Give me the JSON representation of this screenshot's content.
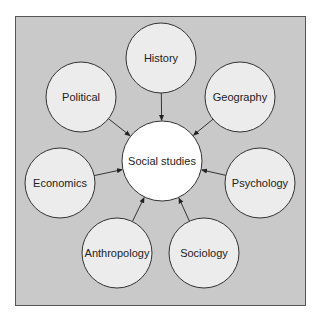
{
  "diagram": {
    "type": "hub-and-spoke concept map",
    "colors": {
      "panel_bg": "#c9c9c9",
      "panel_border": "#555555",
      "node_fill": "#ececec",
      "center_fill": "#ffffff",
      "stroke": "#333333"
    },
    "center": {
      "label": "Social studies",
      "cx": 162,
      "cy": 161,
      "r": 40
    },
    "nodes": [
      {
        "label": "History",
        "cx": 161,
        "cy": 58,
        "r": 35
      },
      {
        "label": "Geography",
        "cx": 240,
        "cy": 97,
        "r": 35
      },
      {
        "label": "Psychology",
        "cx": 260,
        "cy": 183,
        "r": 35
      },
      {
        "label": "Sociology",
        "cx": 204,
        "cy": 253,
        "r": 35
      },
      {
        "label": "Anthropology",
        "cx": 117,
        "cy": 253,
        "r": 35
      },
      {
        "label": "Economics",
        "cx": 60,
        "cy": 183,
        "r": 35
      },
      {
        "label": "Political",
        "cx": 81,
        "cy": 97,
        "r": 35
      }
    ]
  }
}
